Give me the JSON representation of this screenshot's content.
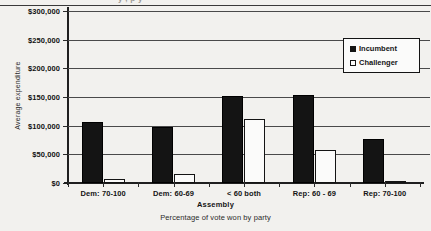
{
  "chart_data": {
    "type": "bar",
    "title": "",
    "xlabel": "Percentage of vote won by party",
    "ylabel": "Average expenditure",
    "group_label": "Assembly",
    "categories": [
      "Dem: 70-100",
      "Dem: 60-69",
      "< 60 both",
      "Rep: 60 - 69",
      "Rep: 70-100"
    ],
    "series": [
      {
        "name": "Incumbent",
        "style": "filled",
        "values": [
          107000,
          98000,
          152000,
          153000,
          76000
        ]
      },
      {
        "name": "Challenger",
        "style": "hollow",
        "values": [
          7000,
          16000,
          111000,
          57000,
          3000
        ]
      }
    ],
    "ylim": [
      0,
      300000
    ],
    "ytick_values": [
      0,
      50000,
      100000,
      150000,
      200000,
      250000,
      300000
    ],
    "ytick_labels": [
      "$0",
      "$50,000",
      "$100,000",
      "$150,000",
      "$200,000",
      "$250,000",
      "$300,000"
    ],
    "grid": true,
    "grid_axis": "y",
    "legend_position": "upper-right",
    "colors": {
      "incumbent": "#141414",
      "challenger": "#fbfbfa",
      "outline": "#141414",
      "grid": "#4a4a4a",
      "background": "#f2f1ee"
    }
  },
  "legend": {
    "entries": [
      {
        "label": "Incumbent"
      },
      {
        "label": "Challenger"
      }
    ]
  },
  "title_sliver": "y    ,  p   y"
}
